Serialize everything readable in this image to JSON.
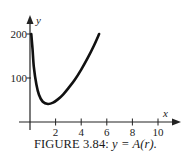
{
  "figure": {
    "caption_prefix": "FIGURE 3.84: ",
    "caption_math": "y = A(r).",
    "caption_full": "FIGURE 3.84: y = A(r)."
  },
  "chart_data": {
    "type": "line",
    "title": "FIGURE 3.84: y = A(r).",
    "xlabel": "x",
    "ylabel": "y",
    "xlim": [
      -0.8,
      11.5
    ],
    "ylim": [
      -10,
      225
    ],
    "x_ticks": [
      2,
      4,
      6,
      8,
      10
    ],
    "x_tick_labels": [
      "2",
      "4",
      "6",
      "8",
      "10"
    ],
    "y_ticks": [
      100,
      200
    ],
    "y_tick_labels": [
      "100",
      "200"
    ],
    "grid": false,
    "legend": null,
    "series": [
      {
        "name": "A(r)",
        "x": [
          0.1,
          0.2,
          0.3,
          0.5,
          0.7,
          1.0,
          1.4,
          1.8,
          2.2,
          2.6,
          3.0,
          3.5,
          4.0,
          4.5,
          5.0,
          5.4
        ],
        "y": [
          200,
          165,
          125,
          85,
          62,
          46,
          41,
          44,
          52,
          63,
          77,
          96,
          119,
          145,
          174,
          200
        ]
      }
    ]
  }
}
